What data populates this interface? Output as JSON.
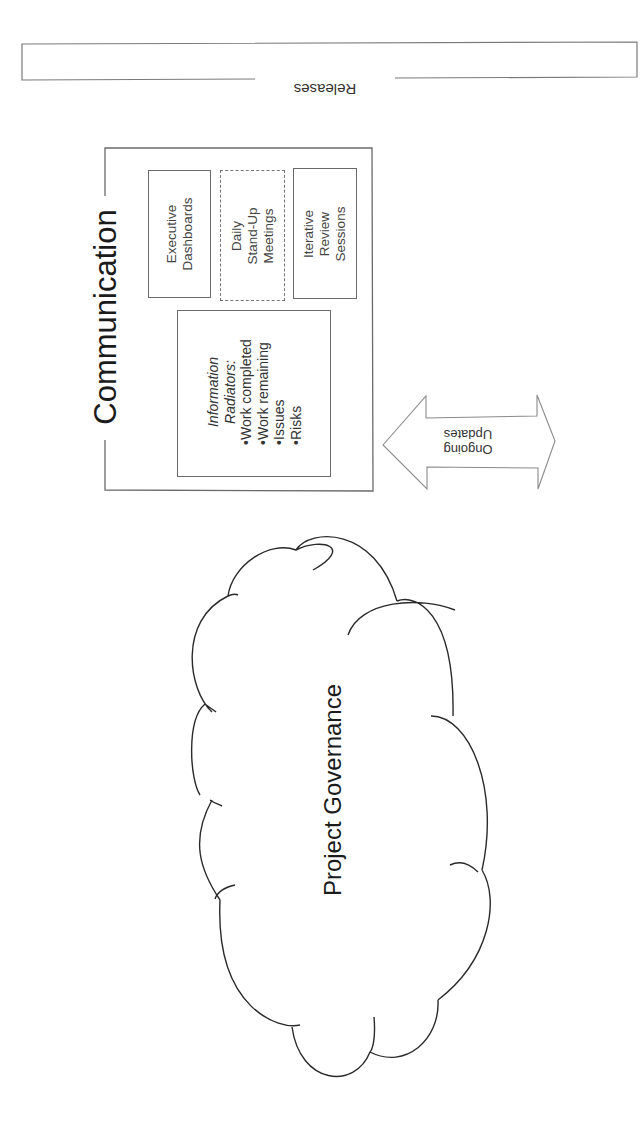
{
  "releases": {
    "label": "Releases"
  },
  "communication": {
    "title": "Communication",
    "executive_dashboards": {
      "line1": "Executive",
      "line2": "Dashboards"
    },
    "daily_standup": {
      "line1": "Daily",
      "line2": "Stand-Up",
      "line3": "Meetings"
    },
    "iterative_review": {
      "line1": "Iterative",
      "line2": "Review",
      "line3": "Sessions"
    },
    "information_radiators": {
      "heading1": "Information",
      "heading2": "Radiators:",
      "items": [
        "•Work completed",
        "•Work remaining",
        "•Issues",
        "•Risks"
      ]
    }
  },
  "arrow": {
    "line1": "Ongoing",
    "line2": "Updates"
  },
  "cloud": {
    "label": "Project Governance"
  },
  "colors": {
    "stroke": "#6a6a6a",
    "cloud_stroke": "#2a2a2a",
    "background": "#ffffff"
  }
}
